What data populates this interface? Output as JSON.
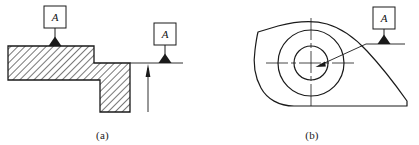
{
  "figure": {
    "background_color": "#ffffff",
    "line_color": "#1a1a1a",
    "hatch_color": "#555555"
  },
  "panels": [
    {
      "id": "a",
      "caption": "(a)",
      "description": "Stepped part cross-section with hatching; datum feature symbols placed on surface and on extension line",
      "datums": [
        {
          "name": "datum-feature-symbol-a1",
          "letter": "A",
          "placement": "on-surface",
          "box": {
            "x": 44,
            "y": 6,
            "w": 22,
            "h": 22
          },
          "leader": {
            "x1": 55,
            "y1": 28,
            "x2": 55,
            "y2": 46
          },
          "triangle": {
            "cx": 55,
            "cy": 46,
            "w": 13,
            "h": 9,
            "filled": true
          }
        },
        {
          "name": "datum-feature-symbol-a2",
          "letter": "A",
          "placement": "on-extension-line",
          "box": {
            "x": 154,
            "y": 23,
            "w": 22,
            "h": 22
          },
          "leader": {
            "x1": 165,
            "y1": 45,
            "x2": 165,
            "y2": 63
          },
          "triangle": {
            "cx": 165,
            "cy": 63,
            "w": 13,
            "h": 9,
            "filled": true
          }
        }
      ],
      "extension_line": {
        "x1": 130,
        "y1": 63,
        "x2": 183,
        "y2": 63
      },
      "dimension_arrow": {
        "name": "dimension-arrow-up",
        "x": 148,
        "y_top": 66,
        "y_bottom": 112,
        "direction": "up"
      },
      "profile_points": "8,46 94,46 94,63 130,63 130,112 100,112 100,80 8,80",
      "hatched": true
    },
    {
      "id": "b",
      "caption": "(b)",
      "description": "Cam-shaped part with concentric bore circles and centerlines; datum feature symbol attached by leader to the bore",
      "datum": {
        "name": "datum-feature-symbol-b",
        "letter": "A",
        "placement": "leader-to-feature",
        "box": {
          "x": 168,
          "y": 7,
          "w": 22,
          "h": 22
        },
        "leader": {
          "x1": 179,
          "y1": 29,
          "x2": 179,
          "y2": 44
        },
        "triangle": {
          "cx": 179,
          "cy": 44,
          "w": 13,
          "h": 9,
          "filled": true
        },
        "base_line": {
          "x1": 161,
          "y1": 44,
          "x2": 200,
          "y2": 44
        },
        "pointer_line": {
          "x1": 161,
          "y1": 44,
          "x2": 112,
          "y2": 66
        },
        "arrow_tip": {
          "x": 112,
          "y": 66
        }
      },
      "circles": [
        {
          "name": "outer-bore-circle",
          "cx": 106,
          "cy": 63,
          "r": 33
        },
        {
          "name": "inner-bore-circle",
          "cx": 106,
          "cy": 63,
          "r": 17
        }
      ],
      "centerlines": {
        "horizontal": {
          "x1": 61,
          "y1": 63,
          "x2": 151,
          "y2": 63
        },
        "vertical": {
          "x1": 106,
          "y1": 18,
          "x2": 106,
          "y2": 108
        }
      },
      "outline_path": "M 53,32 L 73,26 C 92,21 108,20 122,24 C 136,28 150,38 162,51 C 176,66 190,84 202,101 L 202,106 L 89,106 C 74,106 62,99 56,88 C 50,77 48,63 50,50 C 51,42 52,36 53,32 Z"
    }
  ]
}
